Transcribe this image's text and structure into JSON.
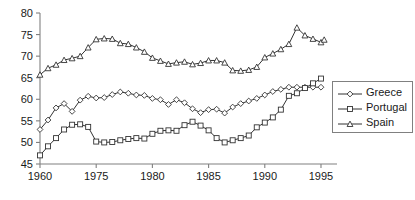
{
  "chart_data": {
    "type": "line",
    "title": "",
    "subtitle": "",
    "xlabel": "",
    "ylabel": "",
    "xlim": [
      1960,
      1995.5
    ],
    "ylim": [
      45,
      80
    ],
    "grid": false,
    "legend_position": "right",
    "x_tick_labels": [
      "1960",
      "1975",
      "1980",
      "1985",
      "1990",
      "1995"
    ],
    "x_tick_values": [
      1960,
      1967,
      1974,
      1981,
      1988,
      1995
    ],
    "y_tick_labels": [
      "45",
      "50",
      "55",
      "60",
      "65",
      "70",
      "75",
      "80"
    ],
    "y_tick_values": [
      45,
      50,
      55,
      60,
      65,
      70,
      75,
      80
    ],
    "x": [
      1960,
      1961,
      1962,
      1963,
      1964,
      1965,
      1966,
      1967,
      1968,
      1969,
      1970,
      1971,
      1972,
      1973,
      1974,
      1975,
      1976,
      1977,
      1978,
      1979,
      1980,
      1981,
      1982,
      1983,
      1984,
      1985,
      1986,
      1987,
      1988,
      1989,
      1990,
      1991,
      1992,
      1993,
      1994,
      1995
    ],
    "series": [
      {
        "name": "Greece",
        "marker": "diamond",
        "values": [
          53.0,
          55.2,
          58.0,
          59.0,
          57.2,
          59.8,
          60.7,
          60.3,
          60.4,
          61.1,
          61.7,
          61.4,
          61.0,
          60.9,
          60.2,
          59.9,
          58.8,
          59.9,
          59.2,
          57.8,
          56.9,
          57.6,
          57.7,
          56.8,
          58.2,
          59.0,
          59.6,
          60.2,
          61.0,
          61.8,
          62.3,
          62.8,
          62.8,
          62.8,
          62.8,
          62.8
        ]
      },
      {
        "name": "Portugal",
        "marker": "square",
        "values": [
          47.0,
          49.1,
          51.0,
          53.0,
          54.1,
          54.2,
          53.6,
          50.2,
          50.0,
          50.1,
          50.5,
          50.8,
          51.0,
          50.9,
          52.0,
          52.7,
          52.8,
          52.7,
          54.0,
          54.8,
          53.9,
          52.8,
          51.0,
          50.0,
          50.5,
          51.0,
          51.6,
          53.5,
          54.6,
          55.8,
          57.6,
          60.8,
          61.4,
          62.6,
          63.7,
          64.8
        ]
      },
      {
        "name": "Spain",
        "marker": "triangle",
        "values": [
          65.7,
          67.2,
          68.0,
          69.1,
          69.5,
          70.0,
          72.0,
          73.9,
          74.1,
          74.0,
          73.0,
          72.8,
          72.0,
          71.0,
          69.6,
          68.9,
          68.2,
          68.5,
          68.7,
          68.1,
          68.4,
          69.0,
          69.0,
          68.5,
          66.7,
          66.6,
          66.8,
          67.5,
          69.7,
          70.6,
          71.6,
          72.8,
          76.6,
          74.8,
          74.0,
          73.2
        ]
      }
    ],
    "series_final_extra": [
      {
        "name": "Spain",
        "x": 1995.4,
        "value": 73.8
      }
    ]
  },
  "legend": {
    "items": [
      {
        "label": "Greece",
        "marker": "diamond"
      },
      {
        "label": "Portugal",
        "marker": "square"
      },
      {
        "label": "Spain",
        "marker": "triangle"
      }
    ]
  }
}
